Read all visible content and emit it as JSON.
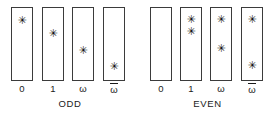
{
  "figure": {
    "width": 275,
    "height": 116,
    "background": "#ffffff",
    "ink_color": "#1a1a1a",
    "box_border_color": "#3b3b3b",
    "mark_glyph": "✳",
    "groups": [
      {
        "name": "odd",
        "label": "ODD",
        "left": 0,
        "columns": [
          {
            "label": "0",
            "label_overline": false,
            "left": 11,
            "marks": [
              18
            ]
          },
          {
            "label": "1",
            "label_overline": false,
            "left": 42,
            "marks": [
              35
            ]
          },
          {
            "label": "ω",
            "label_overline": false,
            "left": 72,
            "marks": [
              58
            ]
          },
          {
            "label": "ω",
            "label_overline": true,
            "left": 103,
            "marks": [
              80
            ]
          }
        ]
      },
      {
        "name": "even",
        "label": "EVEN",
        "left": 140,
        "columns": [
          {
            "label": "0",
            "label_overline": false,
            "left": 10,
            "marks": []
          },
          {
            "label": "1",
            "label_overline": false,
            "left": 40,
            "marks": [
              16,
              33
            ]
          },
          {
            "label": "ω",
            "label_overline": false,
            "left": 70,
            "marks": [
              16,
              55
            ]
          },
          {
            "label": "ω",
            "label_overline": true,
            "left": 101,
            "marks": [
              16,
              78
            ]
          }
        ]
      }
    ]
  }
}
